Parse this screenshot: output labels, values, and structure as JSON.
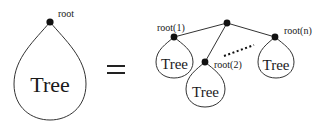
{
  "diagram": {
    "type": "tree-recursive-definition",
    "left": {
      "root_label": "root",
      "tree_label": "Tree"
    },
    "operator": "=",
    "right": {
      "parent_node": "unlabeled",
      "children": [
        {
          "root_label": "root(1)",
          "tree_label": "Tree"
        },
        {
          "root_label": "root(2)",
          "tree_label": "Tree"
        },
        {
          "root_label": "root(n)",
          "tree_label": "Tree"
        }
      ],
      "ellipsis": "dotted-line"
    },
    "colors": {
      "stroke": "#333333",
      "node": "#111111",
      "text": "#1a1a1a",
      "background": "#ffffff"
    }
  }
}
